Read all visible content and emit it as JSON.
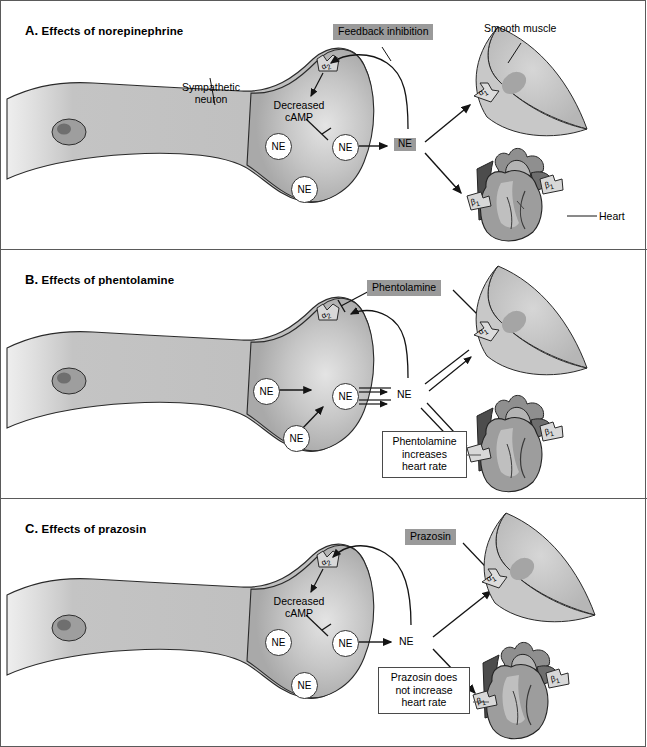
{
  "figure": {
    "panel_count": 3,
    "colors": {
      "chip_background": "#9a9a9a",
      "neuron_fill": "#b9b9b9",
      "muscle_fill": "#c2c2c2",
      "heart_fill": "#9d9d9d",
      "border": "#5a5a5a",
      "stroke": "#1a1a1a"
    }
  },
  "panels": [
    {
      "id": "a",
      "letter": "A.",
      "title": "Effects of norepinephrine",
      "labels": {
        "neuron": "Sympathetic\nneuron",
        "neuron_line1": "Sympathetic",
        "neuron_line2": "neuron",
        "feedback": "Feedback inhibition",
        "camp_line1": "Decreased",
        "camp_line2": "cAMP",
        "smooth_muscle": "Smooth muscle",
        "heart": "Heart",
        "ne_vesicle_1": "NE",
        "ne_vesicle_2": "NE",
        "ne_membrane": "NE",
        "ne_cleft": "NE",
        "alpha2": "α2",
        "alpha1": "α1",
        "beta1_left": "β1",
        "beta1_right": "β1"
      }
    },
    {
      "id": "b",
      "letter": "B.",
      "title": "Effects of phentolamine",
      "labels": {
        "drug": "Phentolamine",
        "note_line1": "Phentolamine",
        "note_line2": "increases",
        "note_line3": "heart rate",
        "ne_vesicle_1": "NE",
        "ne_vesicle_2": "NE",
        "ne_membrane": "NE",
        "ne_cleft": "NE",
        "alpha2": "α2",
        "alpha1": "α1",
        "beta1_right": "β1"
      }
    },
    {
      "id": "c",
      "letter": "C.",
      "title": "Effects of prazosin",
      "labels": {
        "drug": "Prazosin",
        "camp_line1": "Decreased",
        "camp_line2": "cAMP",
        "note_line1": "Prazosin does",
        "note_line2": "not increase",
        "note_line3": "heart rate",
        "ne_vesicle_1": "NE",
        "ne_vesicle_2": "NE",
        "ne_membrane": "NE",
        "ne_cleft": "NE",
        "alpha2": "α2",
        "alpha1": "α1",
        "beta1_right": "β1"
      }
    }
  ]
}
